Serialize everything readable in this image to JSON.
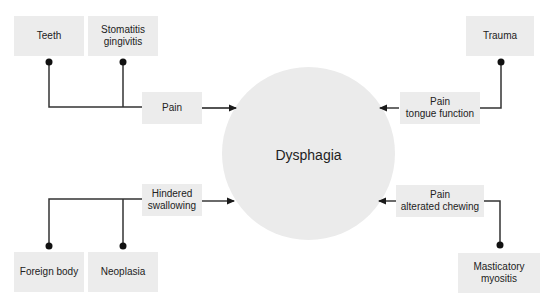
{
  "diagram": {
    "center": {
      "label": "Dysphagia"
    },
    "causes": {
      "teeth": "Teeth",
      "stomatitis": "Stomatitis\ngingivitis",
      "trauma": "Trauma",
      "foreign_body": "Foreign body",
      "neoplasia": "Neoplasia",
      "masticatory_myositis": "Masticatory\nmyositis"
    },
    "mechanisms": {
      "pain": "Pain",
      "pain_tongue_function": "Pain\ntongue function",
      "hindered_swallowing": "Hindered\nswallowing",
      "pain_alterated_chewing": "Pain\nalterated chewing"
    },
    "colors": {
      "box_fill": "#ececec",
      "circle_fill": "#ebebeb",
      "line": "#333333",
      "text": "#222222"
    }
  }
}
